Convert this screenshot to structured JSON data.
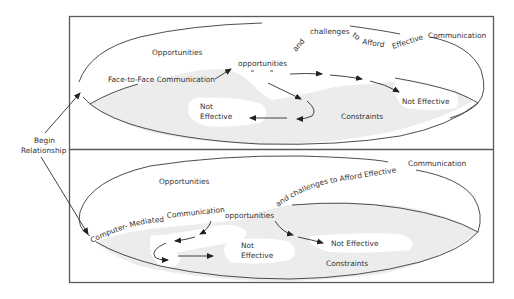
{
  "diagram": {
    "left_label": {
      "line1": "Begin",
      "line2": "Relationship"
    },
    "panels": [
      {
        "id": "face-to-face",
        "opportunities_label": "Opportunities",
        "start_label": "Face-to-Face Communication",
        "center_label": "opportunities",
        "curved_words": [
          "and",
          "challenges",
          "to",
          "Afford",
          "Effective",
          "Communication"
        ],
        "not_effective_left": {
          "line1": "Not",
          "line2": "Effective"
        },
        "not_effective_right": "Not Effective",
        "constraints_label": "Constraints"
      },
      {
        "id": "computer-mediated",
        "opportunities_label": "Opportunities",
        "start_label_part1": "Computer- Mediated",
        "start_label_part2": "Communication",
        "center_label": "opportunities",
        "curved_phrase": "and challenges  to Afford  Effective",
        "end_word": "Communication",
        "not_effective_left": {
          "line1": "Not",
          "line2": "Effective"
        },
        "not_effective_right": "Not Effective",
        "constraints_label": "Constraints"
      }
    ],
    "colors": {
      "stroke": "#3a3a3a",
      "shade": "#ececec",
      "text": "#333333",
      "frame": "#5a5a5a"
    }
  }
}
